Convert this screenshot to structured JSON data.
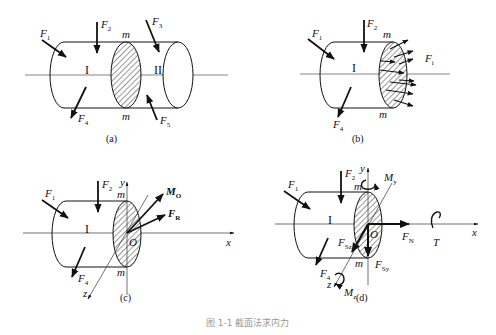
{
  "figure": {
    "caption": "图 1-1  截面法求内力",
    "panels": [
      {
        "id": "a",
        "label": "(a)",
        "section_label_top": "m",
        "section_label_bottom": "m",
        "part_left": "I",
        "part_right": "II",
        "forces": [
          {
            "name": "F",
            "sub": "1"
          },
          {
            "name": "F",
            "sub": "2"
          },
          {
            "name": "F",
            "sub": "3"
          },
          {
            "name": "F",
            "sub": "4"
          },
          {
            "name": "F",
            "sub": "5"
          }
        ]
      },
      {
        "id": "b",
        "label": "(b)",
        "section_label_top": "m",
        "section_label_bottom": "m",
        "part_left": "I",
        "forces": [
          {
            "name": "F",
            "sub": "1"
          },
          {
            "name": "F",
            "sub": "2"
          },
          {
            "name": "F",
            "sub": "4"
          },
          {
            "name": "F",
            "sub": "i"
          }
        ]
      },
      {
        "id": "c",
        "label": "(c)",
        "section_label_top": "m",
        "section_label_bottom": "m",
        "part_left": "I",
        "origin": "O",
        "axes": {
          "x": "x",
          "y": "y",
          "z": "z"
        },
        "forces": [
          {
            "name": "F",
            "sub": "1"
          },
          {
            "name": "F",
            "sub": "2"
          },
          {
            "name": "F",
            "sub": "4"
          }
        ],
        "resultants": [
          {
            "name": "M",
            "sub": "O"
          },
          {
            "name": "F",
            "sub": "R"
          }
        ]
      },
      {
        "id": "d",
        "label": "(d)",
        "section_label_top": "m",
        "section_label_bottom": "m",
        "part_left": "I",
        "origin": "O",
        "axes": {
          "x": "x",
          "y": "y",
          "z": "z"
        },
        "forces": [
          {
            "name": "F",
            "sub": "1"
          },
          {
            "name": "F",
            "sub": "2"
          },
          {
            "name": "F",
            "sub": "4"
          }
        ],
        "internal_forces": [
          {
            "name": "F",
            "sub": "N"
          },
          {
            "name": "F",
            "sub": "Sy"
          },
          {
            "name": "F",
            "sub": "Sz"
          },
          {
            "name": "T",
            "sub": ""
          },
          {
            "name": "M",
            "sub": "y"
          },
          {
            "name": "M",
            "sub": "z"
          }
        ]
      }
    ]
  }
}
